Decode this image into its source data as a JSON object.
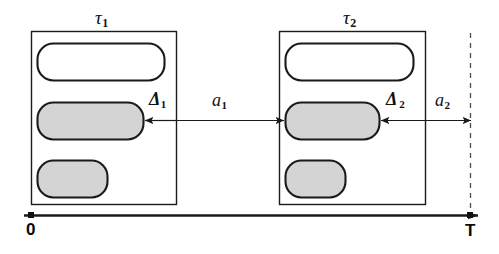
{
  "diagram": {
    "background_color": "#ffffff",
    "stroke_color": "#1a1a1a",
    "fill_gray": "#d4d4d4",
    "fill_white": "#ffffff"
  },
  "frames": [
    {
      "id": "frame-1",
      "label": "τ",
      "label_sub": "1",
      "label_full": "τ1",
      "box": {
        "x": 31,
        "y": 31,
        "w": 145,
        "h": 173
      },
      "bars": [
        {
          "id": "bar-1-1",
          "fill": "white",
          "x": 37,
          "y": 43,
          "w": 127,
          "h": 37,
          "r": 16
        },
        {
          "id": "bar-1-2",
          "fill": "gray",
          "x": 37,
          "y": 102,
          "w": 106,
          "h": 37,
          "r": 16
        },
        {
          "id": "bar-1-3",
          "fill": "gray",
          "x": 37,
          "y": 160,
          "w": 70,
          "h": 37,
          "r": 16
        }
      ]
    },
    {
      "id": "frame-2",
      "label": "τ",
      "label_sub": "2",
      "label_full": "τ2",
      "box": {
        "x": 279,
        "y": 31,
        "w": 146,
        "h": 173
      },
      "bars": [
        {
          "id": "bar-2-1",
          "fill": "white",
          "x": 285,
          "y": 43,
          "w": 128,
          "h": 37,
          "r": 16
        },
        {
          "id": "bar-2-2",
          "fill": "gray",
          "x": 285,
          "y": 102,
          "w": 94,
          "h": 37,
          "r": 16
        },
        {
          "id": "bar-2-3",
          "fill": "gray",
          "x": 285,
          "y": 160,
          "w": 60,
          "h": 37,
          "r": 16
        }
      ]
    }
  ],
  "measures": [
    {
      "id": "delta-1",
      "label": "Δ",
      "label_sub": "1",
      "label_full": "Δ1",
      "from_x": 176,
      "to_x": 143,
      "y": 120,
      "direction": "left",
      "label_x": 150,
      "label_y": 92
    },
    {
      "id": "a-1",
      "label": "a",
      "label_sub": "1",
      "label_full": "a1",
      "from_x": 176,
      "to_x": 283,
      "y": 120,
      "direction": "right",
      "label_x": 215,
      "label_y": 93
    },
    {
      "id": "delta-2",
      "label": "Δ",
      "label_sub": "2",
      "label_full": "Δ2",
      "from_x": 425,
      "to_x": 379,
      "y": 120,
      "direction": "left",
      "label_x": 388,
      "label_y": 92
    },
    {
      "id": "a-2",
      "label": "a",
      "label_sub": "2",
      "label_full": "a2",
      "from_x": 425,
      "to_x": 470,
      "y": 120,
      "direction": "right",
      "label_x": 436,
      "label_y": 93
    }
  ],
  "deadline_line": {
    "id": "deadline-dashed-line",
    "x": 470,
    "y_top": 33,
    "y_bottom": 215,
    "style": "dashed"
  },
  "axis": {
    "id": "time-axis",
    "y": 215,
    "x_start": 24,
    "x_end": 480,
    "start_label": "0",
    "end_label": "T",
    "start_tick_x": 31,
    "end_tick_x": 470,
    "start_label_x": 26,
    "start_label_y": 222,
    "end_label_x": 466,
    "end_label_y": 224
  }
}
